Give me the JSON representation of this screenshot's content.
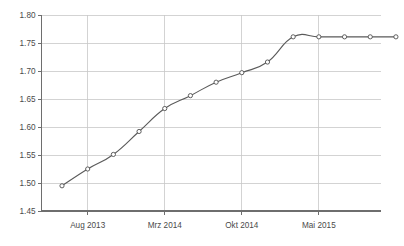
{
  "chart_data": {
    "type": "line",
    "title": "",
    "subtitle": "",
    "xlabel": "",
    "ylabel": "",
    "grid": true,
    "legend": false,
    "legend_position": "none",
    "line_color": "#5a5a5a",
    "marker_color": "#4f4f4f",
    "marker_fill": "#ffffff",
    "grid_color": "#c8c8c8",
    "axis_color": "#6e6e6e",
    "background_color": "#ffffff",
    "ylim": [
      1.45,
      1.8
    ],
    "y_ticks": [
      1.45,
      1.5,
      1.55,
      1.6,
      1.65,
      1.7,
      1.75,
      1.8
    ],
    "y_tick_labels": [
      "1.45",
      "1.50",
      "1.55",
      "1.60",
      "1.65",
      "1.70",
      "1.75",
      "1.80"
    ],
    "x_tick_labels": [
      "Aug 2013",
      "Mrz 2014",
      "Okt 2014",
      "Mai 2015"
    ],
    "x_tick_indices": [
      1,
      4,
      7,
      10
    ],
    "x_index_range": [
      0,
      13
    ],
    "series": [
      {
        "name": "series-1",
        "x": [
          0,
          1,
          2,
          3,
          4,
          5,
          6,
          7,
          8,
          9,
          10,
          11,
          12,
          13
        ],
        "values": [
          1.495,
          1.525,
          1.551,
          1.592,
          1.633,
          1.656,
          1.68,
          1.697,
          1.716,
          1.761,
          1.761,
          1.761,
          1.761,
          1.761
        ]
      }
    ]
  }
}
